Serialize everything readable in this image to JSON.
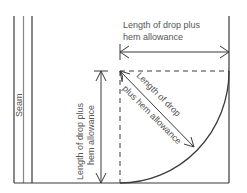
{
  "diagram": {
    "labels": {
      "seam": "Seam",
      "horizontal_line1": "Length of drop plus",
      "horizontal_line2": "hem allowance",
      "vertical_line1": "Length of drop plus",
      "vertical_line2": "hem allowance",
      "diagonal_line1": "Length of drop",
      "diagonal_line2": "plus hem allowance"
    },
    "colors": {
      "line": "#3a3a3a",
      "text": "#555555",
      "background": "#ffffff"
    }
  }
}
